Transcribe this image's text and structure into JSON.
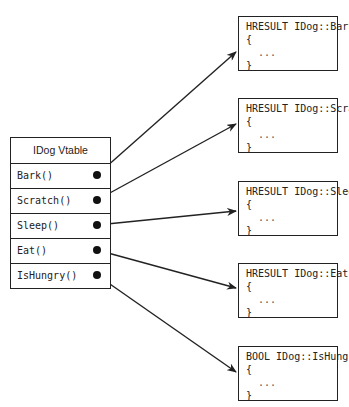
{
  "vtable": {
    "title": "IDog Vtable",
    "entries": [
      {
        "label": "Bark()"
      },
      {
        "label": "Scratch()"
      },
      {
        "label": "Sleep()"
      },
      {
        "label": "Eat()"
      },
      {
        "label": "IsHungry()"
      }
    ]
  },
  "functions": [
    {
      "signature": "HRESULT IDog::Bark",
      "open": "{",
      "body": "...",
      "close": "}"
    },
    {
      "signature": "HRESULT IDog::Scratch",
      "open": "{",
      "body": "...",
      "close": "}"
    },
    {
      "signature": "HRESULT IDog::Sleep",
      "open": "{",
      "body": "...",
      "close": "}"
    },
    {
      "signature": "HRESULT IDog::Eat",
      "open": "{",
      "body": "...",
      "close": "}"
    },
    {
      "signature": "BOOL IDog::IsHungry",
      "open": "{",
      "body": "...",
      "close": "}"
    }
  ],
  "arrows": [
    {
      "from": "Bark()",
      "to": "HRESULT IDog::Bark"
    },
    {
      "from": "Scratch()",
      "to": "HRESULT IDog::Scratch"
    },
    {
      "from": "Sleep()",
      "to": "HRESULT IDog::Sleep"
    },
    {
      "from": "Eat()",
      "to": "HRESULT IDog::Eat"
    },
    {
      "from": "IsHungry()",
      "to": "BOOL IDog::IsHungry"
    }
  ]
}
